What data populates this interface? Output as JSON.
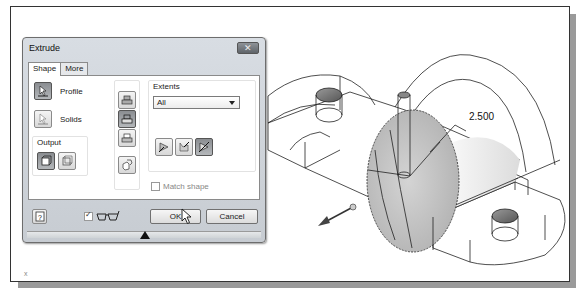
{
  "dialog": {
    "title": "Extrude",
    "close_icon": "close-icon",
    "tabs": [
      {
        "label": "Shape",
        "active": true
      },
      {
        "label": "More",
        "active": false
      }
    ],
    "shape": {
      "profile_label": "Profile",
      "solids_label": "Solids",
      "output_label": "Output",
      "output_buttons": [
        {
          "name": "solid-output",
          "pressed": true
        },
        {
          "name": "surface-output",
          "pressed": false
        }
      ],
      "operation_buttons": [
        {
          "name": "join",
          "pressed": false
        },
        {
          "name": "cut",
          "pressed": true
        },
        {
          "name": "intersect",
          "pressed": false
        },
        {
          "name": "new-solid",
          "pressed": false
        }
      ],
      "extents": {
        "label": "Extents",
        "selected": "All",
        "direction_buttons": [
          {
            "name": "direction-1",
            "pressed": false
          },
          {
            "name": "direction-2",
            "pressed": false
          },
          {
            "name": "symmetric",
            "pressed": true
          }
        ]
      },
      "match_shape_label": "Match shape",
      "match_shape_checked": false
    },
    "footer": {
      "help_icon": "help-icon",
      "preview_checked": true,
      "preview_icon": "glasses-icon",
      "ok_label": "OK",
      "cancel_label": "Cancel"
    }
  },
  "viewport": {
    "dimension_value": "2.500",
    "axis_label": "x"
  }
}
